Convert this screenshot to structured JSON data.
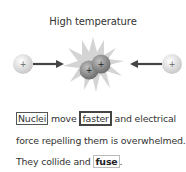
{
  "title": "High temperature",
  "diagram": {
    "left_nucleus": {
      "charge": "+"
    },
    "right_nucleus": {
      "charge": "+"
    },
    "fused_nuclei": [
      {
        "charge": "+"
      },
      {
        "charge": "+"
      }
    ],
    "colors": {
      "nucleus": "#d8d8d8",
      "fused": "#8a8a8a",
      "burst": "#cfcfcf",
      "arrow": "#444444"
    }
  },
  "caption": {
    "w1": "Nuclei",
    "t1": " move ",
    "w2": "faster",
    "t2": " and electrical force repelling them is overwhelmed. They collide and ",
    "w3": "fuse",
    "t3": "."
  }
}
